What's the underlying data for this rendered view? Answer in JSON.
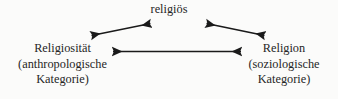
{
  "diagram": {
    "type": "triangular-relationship-diagram",
    "background_color": "#fbfbfa",
    "stroke_color": "#1a1a1a",
    "text_color": "#262626",
    "nodes": {
      "top": {
        "id": "religioes",
        "lines": [
          "religiös"
        ]
      },
      "left": {
        "id": "religiositaet",
        "lines": [
          "Religiosität",
          "(anthropologische",
          "Kategorie)"
        ]
      },
      "right": {
        "id": "religion",
        "lines": [
          "Religion",
          "(soziologische",
          "Kategorie)"
        ]
      }
    },
    "connectors": [
      {
        "id": "left-to-top",
        "label": "bidirectional-arrow-religiositaet-religioes",
        "style": "double-headed",
        "from": "religiositaet",
        "to": "religioes"
      },
      {
        "id": "top-to-right",
        "label": "bidirectional-arrow-religioes-religion",
        "style": "double-headed",
        "from": "religioes",
        "to": "religion"
      },
      {
        "id": "left-to-right",
        "label": "bidirectional-arrow-religiositaet-religion",
        "style": "double-headed",
        "from": "religiositaet",
        "to": "religion"
      }
    ]
  }
}
